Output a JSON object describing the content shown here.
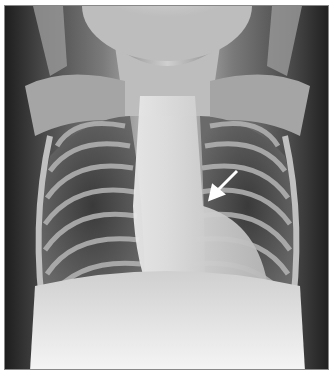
{
  "image": {
    "subject": "Frontal chest radiograph of a child",
    "annotation": {
      "type": "arrow",
      "color": "#ffffff",
      "pointing": "left heart border / left hilar region"
    }
  }
}
